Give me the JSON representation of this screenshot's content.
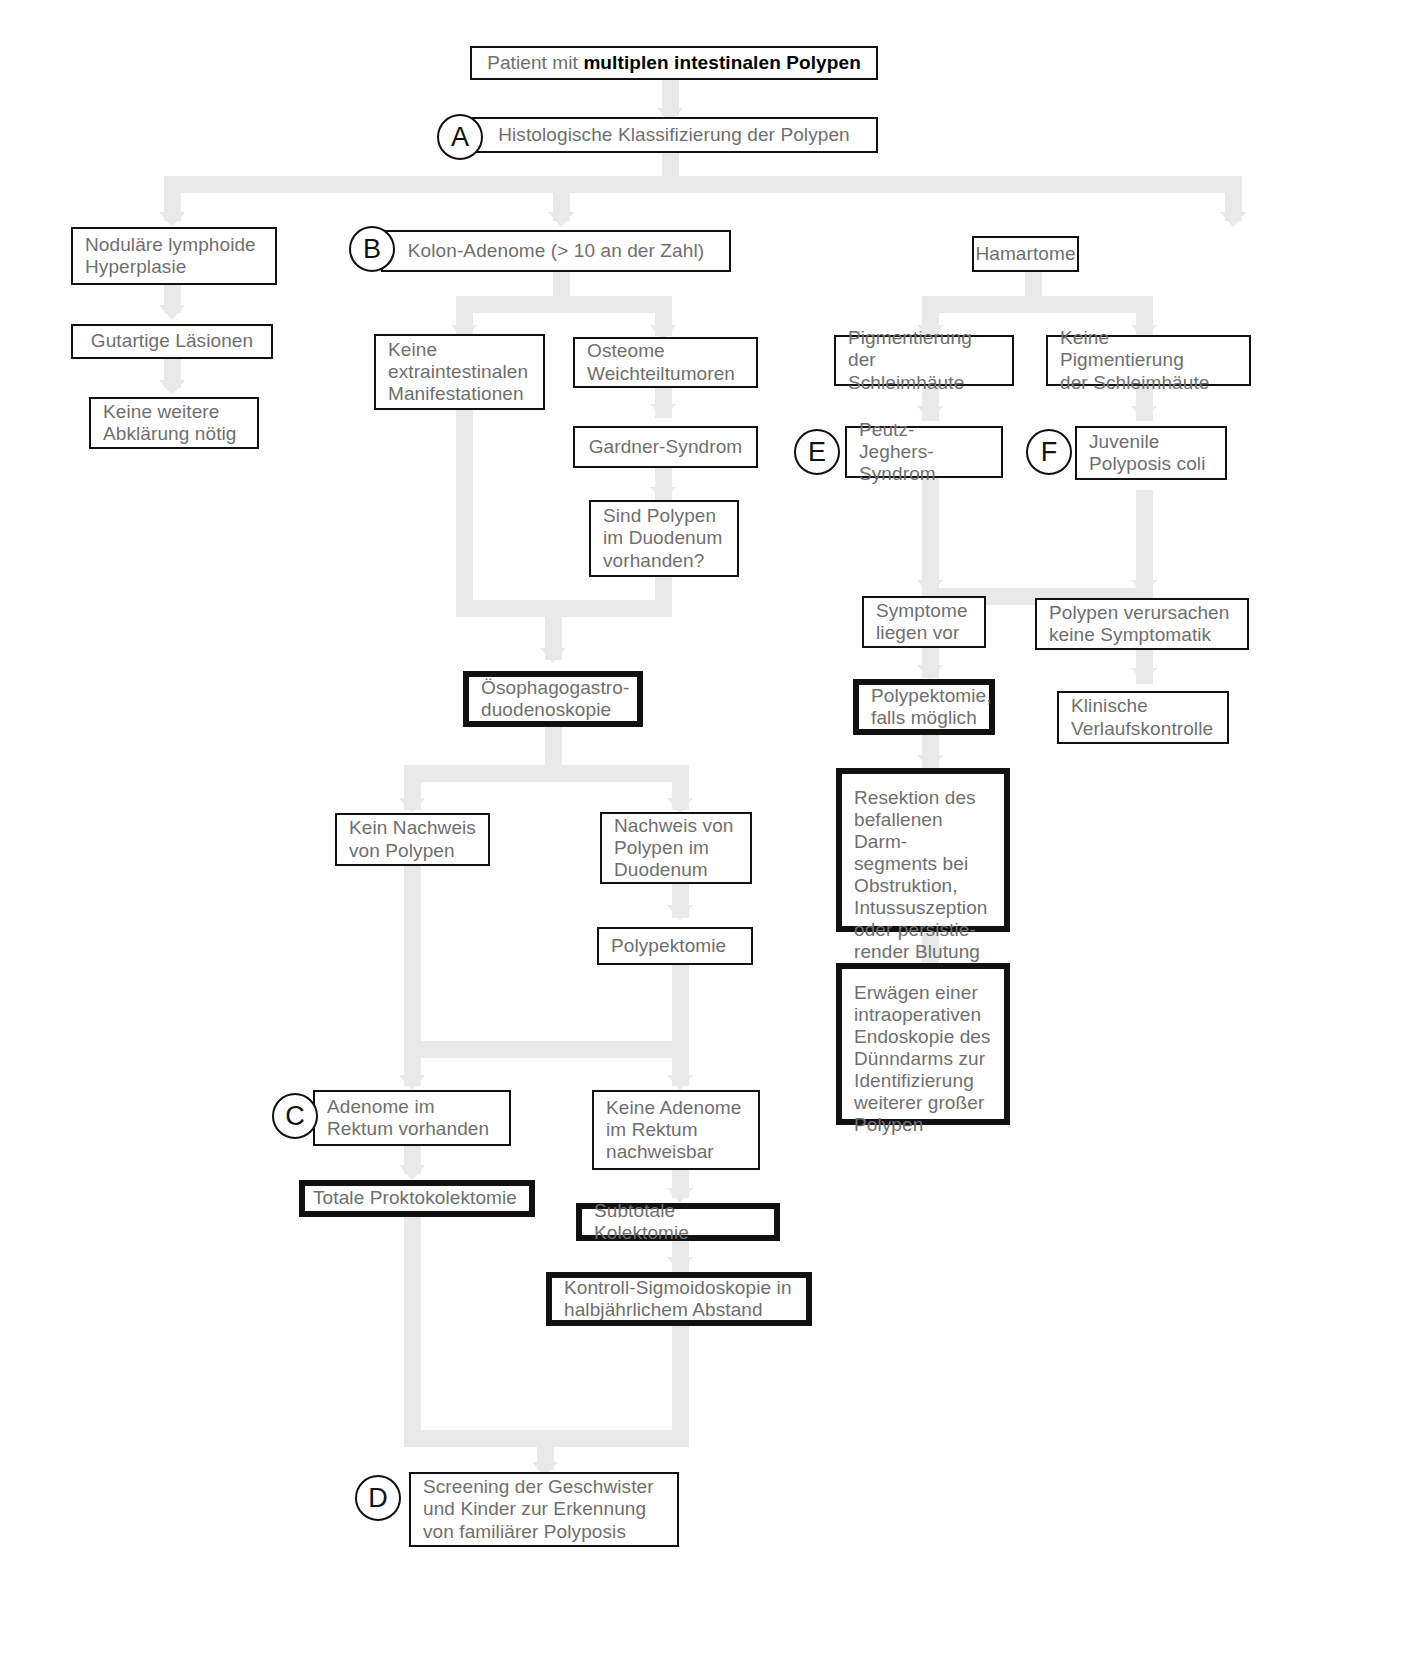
{
  "diagram": {
    "language": "de",
    "connector_color": "#e9e9e9",
    "box_border_color": "#111111",
    "text_color": "#6f6f6f",
    "emphasis_color": "#000000"
  },
  "markers": [
    {
      "id": "A",
      "label": "A"
    },
    {
      "id": "B",
      "label": "B"
    },
    {
      "id": "C",
      "label": "C"
    },
    {
      "id": "D",
      "label": "D"
    },
    {
      "id": "E",
      "label": "E"
    },
    {
      "id": "F",
      "label": "F"
    }
  ],
  "nodes": {
    "patient": {
      "pre": "Patient mit ",
      "bold": "multiplen intestinalen Polypen"
    },
    "histo": {
      "text": "Histologische Klassifizierung der Polypen"
    },
    "noduläre": {
      "text": "Noduläre lymphoide\nHyperplasie"
    },
    "gutartige": {
      "text": "Gutartige Läsionen"
    },
    "keine_weitere": {
      "text": "Keine weitere\nAbklärung nötig"
    },
    "kolon": {
      "text": "Kolon-Adenome (> 10 an der Zahl)"
    },
    "hamartome": {
      "text": "Hamartome"
    },
    "keine_extra": {
      "text": "Keine\nextraintestinalen\nManifestationen"
    },
    "osteome": {
      "text": "Osteome\nWeichteiltumoren"
    },
    "gardner": {
      "text": "Gardner-Syndrom"
    },
    "sind_polypen": {
      "text": "Sind Polypen\nim Duodenum\nvorhanden?"
    },
    "pigmentierung": {
      "text": "Pigmentierung der\nSchleimhäute"
    },
    "keine_pigmentierung": {
      "text": "Keine Pigmentierung\nder Schleimhäute"
    },
    "peutz": {
      "text": "Peutz-Jeghers-\nSyndrom"
    },
    "juvenile": {
      "text": "Juvenile\nPolyposis coli"
    },
    "symptome": {
      "text": "Symptome\nliegen vor"
    },
    "polypen_keine_symptomatik": {
      "text": "Polypen verursachen\nkeine Symptomatik"
    },
    "polypektomie_falls": {
      "text": "Polypektomie,\nfalls möglich"
    },
    "klinische": {
      "text": "Klinische\nVerlaufskontrolle"
    },
    "resektion": {
      "text": "Resektion des\nbefallenen Darm-\nsegments bei\nObstruktion,\nIntussuszeption\noder persistie-\nrender Blutung"
    },
    "erwaegen": {
      "text": "Erwägen einer\nintraoperativen\nEndoskopie des\nDünndarms zur\nIdentifizierung\nweiterer großer\nPolypen"
    },
    "oegd": {
      "text": "Ösophagogastro-\nduodenoskopie"
    },
    "kein_nachweis": {
      "text": "Kein Nachweis\nvon Polypen"
    },
    "nachweis": {
      "text": "Nachweis von\nPolypen im\nDuodenum"
    },
    "polypektomie": {
      "text": "Polypektomie"
    },
    "adenome_rektum": {
      "text": "Adenome im\nRektum vorhanden"
    },
    "keine_adenome_rektum": {
      "text": "Keine Adenome\nim Rektum\nnachweisbar"
    },
    "totale": {
      "text": "Totale Proktokolektomie"
    },
    "subtotale": {
      "text": "Subtotale Kolektomie"
    },
    "kontroll": {
      "text": "Kontroll-Sigmoidoskopie in\nhalbjährlichem Abstand"
    },
    "screening": {
      "text": "Screening der Geschwister\nund Kinder zur Erkennung\nvon familiärer Polyposis"
    }
  }
}
